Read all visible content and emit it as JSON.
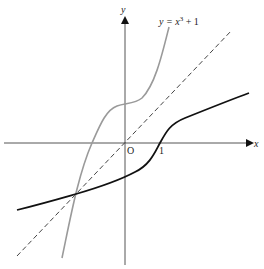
{
  "diagram": {
    "axes": {
      "x_label": "x",
      "y_label": "y",
      "origin_label": "O",
      "tick_label_x": "1"
    },
    "curves": [
      {
        "name": "cubic",
        "equation_label": "y = x³ + 1",
        "color": "#9a9a9a",
        "style": "solid"
      },
      {
        "name": "inverse",
        "color": "#111111",
        "style": "solid",
        "description": "inverse function y = cbrt(x - 1)"
      },
      {
        "name": "line",
        "equation": "y = x",
        "color": "#444444",
        "style": "dashed"
      }
    ],
    "annotation": {
      "label_y": "y = ",
      "label_x": "x",
      "label_exp": "3",
      "label_tail": " + 1"
    }
  }
}
